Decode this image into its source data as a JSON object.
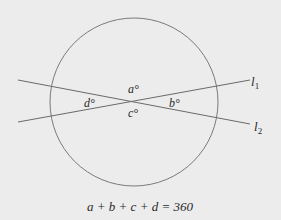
{
  "diagram": {
    "circle": {
      "cx": 134,
      "cy": 102,
      "r": 84,
      "stroke": "#7a7a7a"
    },
    "lines": [
      {
        "name": "l1",
        "label": "l",
        "subscript": "1",
        "x1": 18,
        "y1": 122,
        "x2": 250,
        "y2": 80
      },
      {
        "name": "l2",
        "label": "l",
        "subscript": "2",
        "x1": 18,
        "y1": 80,
        "x2": 250,
        "y2": 124
      }
    ],
    "line_stroke": "#6a6a6a",
    "angles": [
      {
        "name": "a",
        "text": "a°",
        "x": 128,
        "y": 92
      },
      {
        "name": "b",
        "text": "b°",
        "x": 169,
        "y": 106
      },
      {
        "name": "c",
        "text": "c°",
        "x": 128,
        "y": 117
      },
      {
        "name": "d",
        "text": "d°",
        "x": 84,
        "y": 106
      }
    ],
    "equation": "a + b + c + d = 360"
  }
}
